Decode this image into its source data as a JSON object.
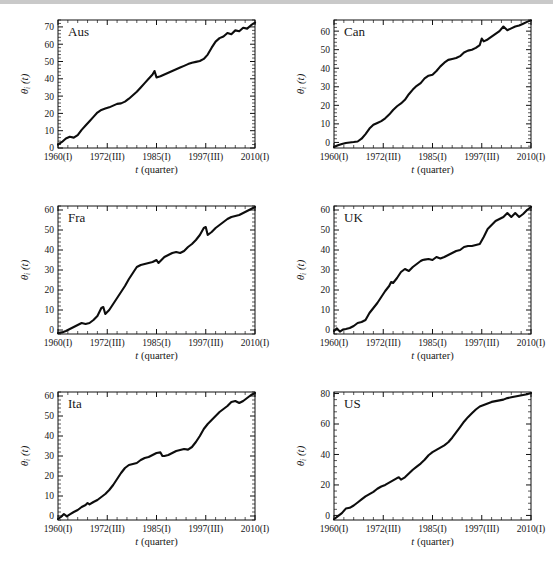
{
  "figure": {
    "xlabel_main": "t",
    "xlabel_paren": "(quarter)",
    "ylabel_theta": "θ",
    "ylabel_sub": "i",
    "ylabel_t": "(t)",
    "x_tick_labels": [
      "1960(I)",
      "1972(III)",
      "1985(I)",
      "1997(III)",
      "2010(I)"
    ],
    "line_color": "#0d0d0d",
    "frame_color": "#111111",
    "background": "#ffffff"
  },
  "chart_data": [
    {
      "type": "line",
      "title": "Aus",
      "xlabel": "t (quarter)",
      "ylabel": "θ_i(t)",
      "xlim": [
        0,
        200
      ],
      "ylim": [
        0,
        74
      ],
      "yticks": [
        0,
        10,
        20,
        30,
        40,
        50,
        60,
        70
      ],
      "xtick_labels": [
        "1960(I)",
        "1972(III)",
        "1985(I)",
        "1997(III)",
        "2010(I)"
      ],
      "xtick_values": [
        0,
        50,
        100,
        150,
        200
      ],
      "grid": false,
      "legend": "none",
      "x": [
        0,
        4,
        8,
        12,
        16,
        20,
        24,
        28,
        32,
        36,
        40,
        44,
        48,
        52,
        56,
        60,
        64,
        68,
        72,
        76,
        80,
        84,
        88,
        92,
        96,
        98,
        100,
        104,
        108,
        112,
        116,
        120,
        124,
        128,
        132,
        136,
        140,
        144,
        148,
        152,
        156,
        160,
        164,
        168,
        172,
        176,
        180,
        184,
        188,
        192,
        196,
        200
      ],
      "values": [
        2.0,
        3.5,
        5.5,
        6.5,
        6.0,
        7.5,
        10.5,
        13.0,
        15.5,
        18.0,
        20.5,
        22.0,
        22.8,
        23.5,
        24.5,
        25.5,
        25.8,
        26.8,
        28.5,
        30.5,
        32.5,
        35.0,
        37.5,
        40.0,
        42.5,
        44.5,
        40.8,
        41.5,
        42.5,
        43.5,
        44.5,
        45.5,
        46.5,
        47.5,
        48.5,
        49.3,
        49.8,
        50.3,
        51.5,
        54.0,
        58.0,
        61.5,
        63.5,
        64.5,
        66.5,
        65.8,
        68.0,
        67.5,
        69.5,
        69.0,
        71.0,
        72.5
      ]
    },
    {
      "type": "line",
      "title": "Can",
      "xlabel": "t (quarter)",
      "ylabel": "θ_i(t)",
      "xlim": [
        0,
        200
      ],
      "ylim": [
        -3,
        66
      ],
      "yticks": [
        0,
        10,
        20,
        30,
        40,
        50,
        60
      ],
      "xtick_labels": [
        "1960(I)",
        "1972(III)",
        "1985(I)",
        "1997(III)",
        "2010(I)"
      ],
      "xtick_values": [
        0,
        50,
        100,
        150,
        200
      ],
      "grid": false,
      "legend": "none",
      "x": [
        0,
        4,
        8,
        12,
        16,
        20,
        24,
        28,
        32,
        36,
        40,
        44,
        48,
        52,
        56,
        60,
        64,
        68,
        72,
        76,
        80,
        84,
        88,
        92,
        96,
        100,
        104,
        108,
        112,
        116,
        120,
        124,
        128,
        132,
        136,
        140,
        144,
        148,
        150,
        152,
        156,
        160,
        164,
        168,
        172,
        176,
        180,
        184,
        188,
        192,
        196,
        200
      ],
      "values": [
        -2.5,
        -1.5,
        -0.8,
        -0.3,
        0.0,
        0.2,
        0.5,
        2.0,
        4.5,
        7.5,
        9.5,
        10.5,
        11.5,
        13.0,
        15.0,
        17.5,
        19.5,
        21.0,
        23.0,
        26.0,
        28.5,
        30.5,
        32.0,
        34.5,
        36.0,
        36.5,
        38.5,
        41.0,
        43.0,
        44.5,
        45.0,
        45.5,
        46.5,
        48.5,
        49.5,
        50.0,
        51.0,
        52.5,
        56.0,
        54.5,
        55.5,
        57.0,
        58.5,
        60.0,
        62.5,
        60.5,
        61.5,
        62.5,
        63.0,
        64.0,
        65.0,
        65.8
      ]
    },
    {
      "type": "line",
      "title": "Fra",
      "xlabel": "t (quarter)",
      "ylabel": "θ_i(t)",
      "xlim": [
        0,
        200
      ],
      "ylim": [
        -2,
        62
      ],
      "yticks": [
        0,
        10,
        20,
        30,
        40,
        50,
        60
      ],
      "xtick_labels": [
        "1960(I)",
        "1972(III)",
        "1985(I)",
        "1997(III)",
        "2010(I)"
      ],
      "xtick_values": [
        0,
        50,
        100,
        150,
        200
      ],
      "grid": false,
      "legend": "none",
      "x": [
        0,
        4,
        8,
        12,
        16,
        20,
        24,
        28,
        32,
        36,
        40,
        44,
        46,
        48,
        52,
        56,
        60,
        64,
        68,
        72,
        76,
        80,
        84,
        88,
        92,
        96,
        100,
        102,
        104,
        108,
        112,
        116,
        120,
        124,
        128,
        132,
        136,
        140,
        144,
        148,
        150,
        152,
        156,
        160,
        164,
        168,
        172,
        176,
        180,
        184,
        188,
        192,
        196,
        200
      ],
      "values": [
        -1.5,
        -1.2,
        -0.5,
        0.5,
        1.5,
        2.5,
        3.5,
        3.0,
        3.5,
        5.0,
        7.0,
        11.0,
        11.5,
        8.0,
        10.0,
        13.0,
        16.0,
        19.0,
        22.0,
        25.5,
        28.5,
        31.5,
        32.5,
        33.0,
        33.5,
        34.0,
        35.0,
        33.5,
        34.5,
        36.5,
        37.5,
        38.5,
        39.0,
        38.5,
        39.5,
        41.5,
        43.0,
        45.0,
        47.5,
        51.0,
        51.5,
        47.5,
        49.0,
        51.0,
        52.5,
        54.0,
        55.5,
        56.5,
        57.0,
        57.5,
        58.5,
        59.5,
        60.5,
        61.5
      ]
    },
    {
      "type": "line",
      "title": "UK",
      "xlabel": "t (quarter)",
      "ylabel": "θ_i(t)",
      "xlim": [
        0,
        200
      ],
      "ylim": [
        -2,
        62
      ],
      "yticks": [
        0,
        10,
        20,
        30,
        40,
        50,
        60
      ],
      "xtick_labels": [
        "1960(I)",
        "1972(III)",
        "1985(I)",
        "1997(III)",
        "2010(I)"
      ],
      "xtick_values": [
        0,
        50,
        100,
        150,
        200
      ],
      "grid": false,
      "legend": "none",
      "x": [
        0,
        3,
        6,
        9,
        12,
        16,
        20,
        24,
        28,
        32,
        36,
        40,
        44,
        48,
        52,
        56,
        58,
        60,
        64,
        68,
        72,
        76,
        80,
        84,
        88,
        90,
        92,
        96,
        100,
        104,
        108,
        112,
        116,
        120,
        124,
        128,
        132,
        136,
        140,
        144,
        148,
        152,
        156,
        160,
        164,
        168,
        172,
        176,
        180,
        184,
        188,
        192,
        196,
        200
      ],
      "values": [
        -0.5,
        0.8,
        -0.8,
        0.2,
        0.5,
        1.0,
        2.0,
        3.5,
        4.0,
        5.0,
        8.5,
        11.0,
        13.5,
        16.5,
        19.5,
        22.0,
        24.0,
        23.5,
        26.0,
        29.0,
        30.5,
        29.5,
        31.5,
        33.0,
        34.5,
        35.0,
        35.2,
        35.5,
        35.0,
        36.5,
        35.8,
        36.5,
        37.5,
        38.5,
        39.5,
        40.0,
        41.5,
        42.0,
        42.0,
        42.5,
        43.0,
        46.5,
        50.5,
        52.5,
        54.5,
        55.5,
        56.5,
        58.5,
        56.5,
        58.5,
        56.5,
        58.0,
        60.0,
        61.5
      ]
    },
    {
      "type": "line",
      "title": "Ita",
      "xlabel": "t (quarter)",
      "ylabel": "θ_i(t)",
      "xlim": [
        0,
        200
      ],
      "ylim": [
        -2,
        62
      ],
      "yticks": [
        0,
        10,
        20,
        30,
        40,
        50,
        60
      ],
      "xtick_labels": [
        "1960(I)",
        "1972(III)",
        "1985(I)",
        "1997(III)",
        "2010(I)"
      ],
      "xtick_values": [
        0,
        50,
        100,
        150,
        200
      ],
      "grid": false,
      "legend": "none",
      "x": [
        0,
        3,
        6,
        9,
        12,
        16,
        20,
        24,
        28,
        30,
        32,
        36,
        40,
        44,
        48,
        52,
        56,
        60,
        64,
        68,
        72,
        76,
        80,
        84,
        88,
        92,
        96,
        100,
        104,
        106,
        108,
        112,
        116,
        120,
        124,
        128,
        132,
        136,
        140,
        144,
        148,
        152,
        156,
        160,
        164,
        168,
        172,
        176,
        180,
        184,
        188,
        192,
        196,
        200
      ],
      "values": [
        -1.5,
        -0.5,
        1.0,
        -0.2,
        0.8,
        2.0,
        3.0,
        4.5,
        5.5,
        6.5,
        5.8,
        7.0,
        8.0,
        9.5,
        11.0,
        13.0,
        15.5,
        18.5,
        21.5,
        24.0,
        25.5,
        26.0,
        26.5,
        28.0,
        29.0,
        29.5,
        30.5,
        31.5,
        31.8,
        30.0,
        30.0,
        30.5,
        31.5,
        32.5,
        33.0,
        33.5,
        33.2,
        34.5,
        37.0,
        40.0,
        43.5,
        46.0,
        48.0,
        50.0,
        52.0,
        53.5,
        55.0,
        57.0,
        57.5,
        56.5,
        57.5,
        59.0,
        60.5,
        61.5
      ]
    },
    {
      "type": "line",
      "title": "US",
      "xlabel": "t (quarter)",
      "ylabel": "θ_i(t)",
      "xlim": [
        0,
        200
      ],
      "ylim": [
        -3,
        81
      ],
      "yticks": [
        0,
        20,
        40,
        60,
        80
      ],
      "xtick_labels": [
        "1960(I)",
        "1972(III)",
        "1985(I)",
        "1997(III)",
        "2010(I)"
      ],
      "xtick_values": [
        0,
        50,
        100,
        150,
        200
      ],
      "grid": false,
      "legend": "none",
      "x": [
        0,
        4,
        8,
        12,
        16,
        20,
        24,
        28,
        32,
        36,
        40,
        44,
        48,
        52,
        56,
        60,
        64,
        66,
        68,
        72,
        76,
        80,
        84,
        88,
        92,
        96,
        100,
        104,
        108,
        112,
        116,
        120,
        124,
        128,
        132,
        136,
        140,
        144,
        148,
        152,
        156,
        160,
        164,
        168,
        172,
        176,
        180,
        184,
        188,
        192,
        196,
        200
      ],
      "values": [
        -2.5,
        -0.5,
        1.5,
        4.5,
        5.0,
        6.5,
        8.5,
        10.5,
        12.5,
        14.0,
        15.5,
        17.5,
        19.0,
        20.0,
        21.5,
        23.0,
        24.5,
        25.0,
        23.5,
        25.0,
        27.5,
        30.0,
        32.0,
        34.0,
        36.5,
        39.5,
        41.5,
        43.0,
        44.5,
        46.0,
        48.0,
        51.0,
        54.5,
        58.0,
        61.5,
        64.5,
        67.0,
        69.5,
        71.5,
        72.5,
        73.5,
        74.5,
        75.0,
        75.5,
        76.0,
        77.0,
        77.5,
        78.0,
        78.5,
        79.0,
        79.5,
        80.3
      ]
    }
  ]
}
